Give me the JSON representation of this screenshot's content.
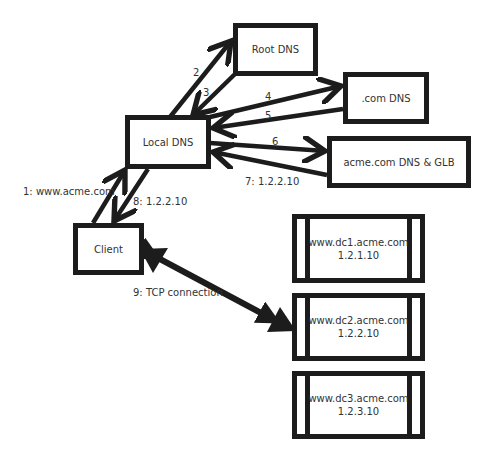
{
  "nodes": {
    "root_dns": "Root DNS",
    "com_dns": ".com DNS",
    "acme_dns": "acme.com DNS & GLB",
    "local_dns": "Local DNS",
    "client": "Client"
  },
  "servers": [
    {
      "host": "www.dc1.acme.com",
      "ip": "1.2.1.10"
    },
    {
      "host": "www.dc2.acme.com",
      "ip": "1.2.2.10"
    },
    {
      "host": "www.dc3.acme.com",
      "ip": "1.2.3.10"
    }
  ],
  "edges": {
    "e1": "1: www.acme.com",
    "e2": "2",
    "e3": "3",
    "e4": "4",
    "e5": "5",
    "e6": "6",
    "e7": "7: 1.2.2.10",
    "e8": "8: 1.2.2.10",
    "e9": "9: TCP connection"
  },
  "colors": {
    "stroke": "#1c1c1c",
    "text": "#333333",
    "background": "#ffffff"
  }
}
